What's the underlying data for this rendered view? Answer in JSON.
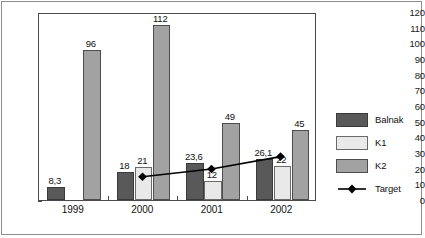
{
  "chart_data": {
    "type": "bar",
    "title": "",
    "subtitle": "",
    "xlabel": "",
    "ylabel": "",
    "categories": [
      "1999",
      "2000",
      "2001",
      "2002"
    ],
    "ylim": [
      0,
      120
    ],
    "ytick_step": 10,
    "yticks": [
      0,
      10,
      20,
      30,
      40,
      50,
      60,
      70,
      80,
      90,
      100,
      110,
      120
    ],
    "ytick_labels": [
      "0",
      "10",
      "20",
      "30",
      "40",
      "50",
      "60",
      "70",
      "80",
      "90",
      "100",
      "110",
      "120"
    ],
    "grid": false,
    "legend_position": "right",
    "series": [
      {
        "name": "Balnak",
        "kind": "bar",
        "color": "#595959",
        "values": [
          8.3,
          18,
          23.6,
          26.1
        ],
        "labels": [
          "8,3",
          "18",
          "23,6",
          "26,1"
        ]
      },
      {
        "name": "K1",
        "kind": "bar",
        "color": "#e9e9e9",
        "values": [
          0,
          21,
          12,
          22
        ],
        "labels": [
          "",
          "21",
          "12",
          "22"
        ]
      },
      {
        "name": "K2",
        "kind": "bar",
        "color": "#a2a2a2",
        "values": [
          96,
          112,
          49,
          45
        ],
        "labels": [
          "96",
          "112",
          "49",
          "45"
        ]
      },
      {
        "name": "Target",
        "kind": "line",
        "color": "#000000",
        "marker": "diamond",
        "values": [
          null,
          15,
          20,
          28
        ],
        "labels": [
          "",
          "",
          "",
          ""
        ]
      }
    ]
  },
  "legend": {
    "items": [
      {
        "label": "Balnak",
        "swatch": "balnak"
      },
      {
        "label": "K1",
        "swatch": "k1"
      },
      {
        "label": "K2",
        "swatch": "k2"
      },
      {
        "label": "Target",
        "swatch": "marker"
      }
    ]
  }
}
